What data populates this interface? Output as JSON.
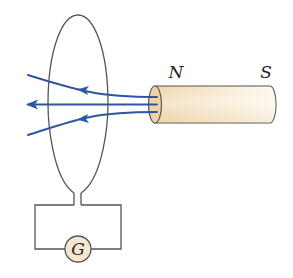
{
  "diagram": {
    "magnet": {
      "north_label": "N",
      "south_label": "S",
      "fill_color": "#f0dcb8",
      "fill_highlight": "#fbf6ea"
    },
    "galvanometer": {
      "label": "G",
      "fill_color": "#f3e8cf"
    },
    "field_lines": {
      "count": 3,
      "color": "#2f55a4",
      "direction": "leftward (out of N pole)"
    },
    "coil": {
      "shape": "loop",
      "stroke_color": "#555555"
    }
  }
}
